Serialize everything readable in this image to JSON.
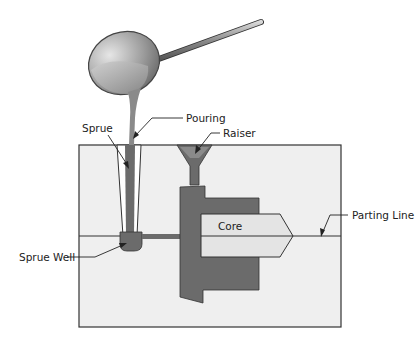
{
  "diagram": {
    "type": "sand-casting-mold",
    "labels": {
      "pouring": "Pouring",
      "sprue": "Sprue",
      "raiser": "Raiser",
      "core": "Core",
      "parting_line": "Parting Line",
      "sprue_well": "Sprue Well"
    },
    "colors": {
      "mold_fill": "#efefef",
      "mold_border": "#333333",
      "metal": "#6b6b6b",
      "core_fill": "#e4e4e4",
      "ladle": "#9a9a9a"
    }
  }
}
